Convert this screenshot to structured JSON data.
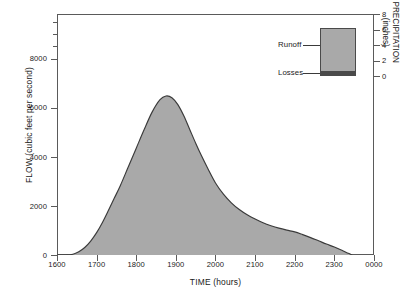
{
  "chart_data": {
    "type": "area",
    "title": "",
    "xlabel": "TIME (hours)",
    "ylabel": "FLOW (cubic feet per second)",
    "y2label": "PRECIPITATION (inches)",
    "xlim": [
      1600,
      2400
    ],
    "ylim": [
      0,
      9700
    ],
    "y2lim": [
      0,
      8
    ],
    "grid": false,
    "legend_position": "inside-top-right",
    "x_tick_labels": [
      "1600",
      "1700",
      "1800",
      "1900",
      "2000",
      "2100",
      "2200",
      "2300",
      "0000"
    ],
    "x_tick_values": [
      1600,
      1700,
      1800,
      1900,
      2000,
      2100,
      2200,
      2300,
      2400
    ],
    "y_tick_labels": [
      "0",
      "2000",
      "4000",
      "6000",
      "8000"
    ],
    "y_tick_values": [
      0,
      2000,
      4000,
      6000,
      8000
    ],
    "y_minor_tick_values": [
      8500,
      9000,
      9500
    ],
    "y2_tick_labels": [
      "0",
      "2",
      "4",
      "6",
      "8"
    ],
    "y2_tick_values": [
      0,
      2,
      4,
      6,
      8
    ],
    "series": [
      {
        "name": "Runoff",
        "fill_color": "#a9a9a9",
        "line_color": "#3a3a3a",
        "x": [
          1600,
          1620,
          1640,
          1655,
          1670,
          1685,
          1700,
          1715,
          1730,
          1745,
          1760,
          1780,
          1800,
          1820,
          1840,
          1860,
          1875,
          1890,
          1905,
          1920,
          1935,
          1950,
          1965,
          1980,
          2000,
          2020,
          2040,
          2060,
          2080,
          2100,
          2120,
          2140,
          2160,
          2180,
          2200,
          2220,
          2240,
          2260,
          2280,
          2300,
          2320,
          2335,
          2345
        ],
        "y": [
          0,
          0,
          30,
          130,
          300,
          560,
          900,
          1320,
          1800,
          2300,
          2800,
          3550,
          4300,
          5050,
          5750,
          6250,
          6400,
          6330,
          6050,
          5600,
          5050,
          4500,
          3980,
          3500,
          2900,
          2450,
          2100,
          1830,
          1620,
          1450,
          1300,
          1180,
          1080,
          1000,
          930,
          820,
          700,
          570,
          440,
          320,
          180,
          70,
          0
        ]
      }
    ],
    "annotations": [
      {
        "label": "Runoff",
        "target": "fill-region"
      },
      {
        "label": "Losses",
        "target": "bottom-band"
      }
    ]
  },
  "legend": {
    "runoff_label": "Runoff",
    "losses_label": "Losses",
    "runoff_color": "#a9a9a9",
    "losses_color": "#4a4a4a"
  },
  "axes": {
    "x_title": "TIME (hours)",
    "y_title": "FLOW (cubic feet per second)",
    "y2_title": "PRECIPITATION\n(inches)",
    "y2_title_line1": "PRECIPITATION",
    "y2_title_line2": "(inches)"
  },
  "ticks": {
    "x": [
      "1600",
      "1700",
      "1800",
      "1900",
      "2000",
      "2100",
      "2200",
      "2300",
      "0000"
    ],
    "y": [
      "8000",
      "6000",
      "4000",
      "2000",
      "0"
    ],
    "y2": [
      "8",
      "6",
      "4",
      "2",
      "0"
    ]
  }
}
